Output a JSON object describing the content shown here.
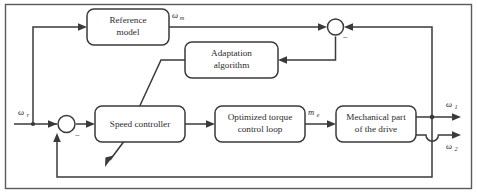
{
  "diagram": {
    "type": "control-block-diagram",
    "line_color": "#3a3a3a",
    "block_fill": "#ffffff",
    "background": "#ffffff"
  },
  "blocks": [
    {
      "id": "reference-model",
      "line1": "Reference",
      "line2": "model"
    },
    {
      "id": "adaptation-algorithm",
      "line1": "Adaptation",
      "line2": "algorithm"
    },
    {
      "id": "speed-controller",
      "line1": "Speed controller",
      "line2": ""
    },
    {
      "id": "optimized-torque-control-loop",
      "line1": "Optimized torque",
      "line2": "control loop"
    },
    {
      "id": "mechanical-part-of-drive",
      "line1": "Mechanical part",
      "line2": "of the drive"
    }
  ],
  "signals": {
    "reference_speed": {
      "symbol": "ω",
      "subscript": "r"
    },
    "model_speed": {
      "symbol": "ω",
      "subscript": "m"
    },
    "electromagnetic_torque": {
      "symbol": "m",
      "subscript": "e"
    },
    "motor_speed": {
      "symbol": "ω",
      "subscript": "1"
    },
    "load_speed": {
      "symbol": "ω",
      "subscript": "2"
    }
  },
  "junctions": {
    "input_summing": {
      "id": "input-summing-junction",
      "sign": "−"
    },
    "error_summing": {
      "id": "error-summing-junction",
      "sign": "−"
    }
  }
}
